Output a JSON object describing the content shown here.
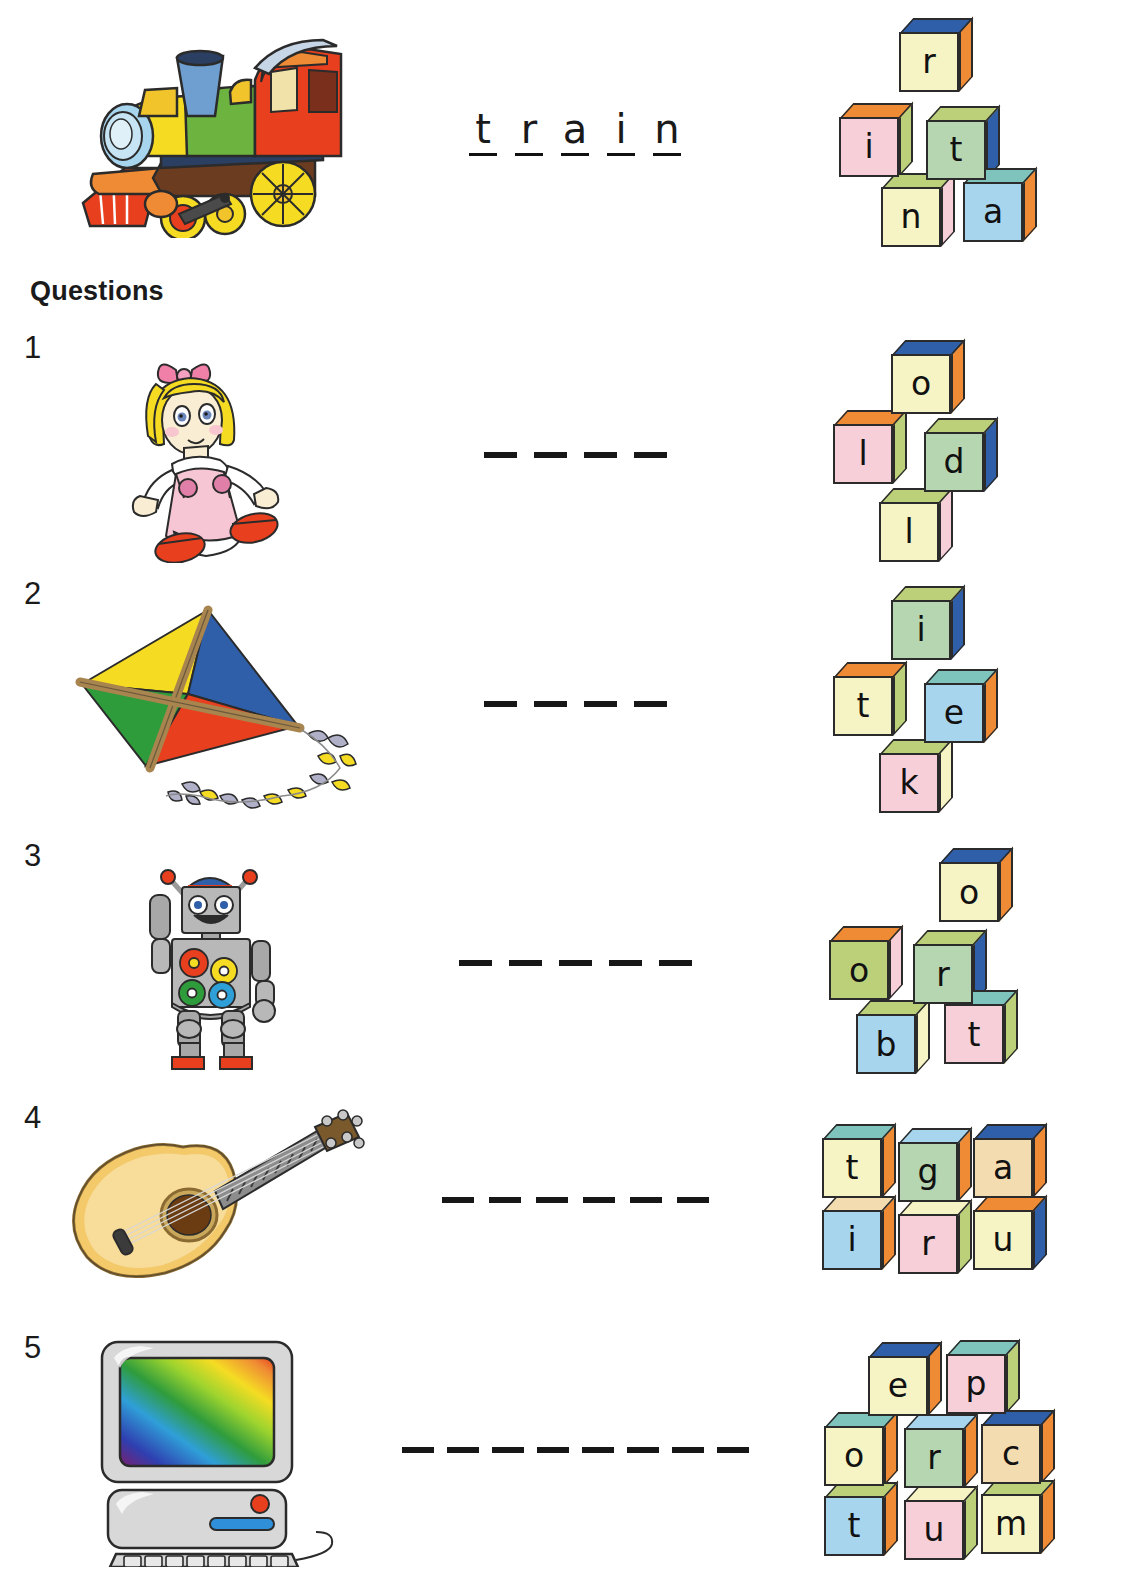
{
  "worksheet": {
    "questions_heading": "Questions"
  },
  "example": {
    "picture": "train-illustration",
    "word_letters": [
      "t",
      "r",
      "a",
      "i",
      "n"
    ],
    "blocks": [
      {
        "letter": "r",
        "front": "#f6f4c4",
        "top": "#2f5fa8",
        "side": "#ef8b34",
        "x": 78,
        "y": 10
      },
      {
        "letter": "i",
        "front": "#f6cfd8",
        "top": "#ef8b34",
        "side": "#bcd07a",
        "x": 18,
        "y": 95
      },
      {
        "letter": "t",
        "front": "#b5d6b0",
        "top": "#bcd07a",
        "side": "#2f5fa8",
        "x": 105,
        "y": 98
      },
      {
        "letter": "n",
        "front": "#f6f4c4",
        "top": "#bcd07a",
        "side": "#f6cfd8",
        "x": 60,
        "y": 165
      },
      {
        "letter": "a",
        "front": "#a8d5ee",
        "top": "#7ec4bd",
        "side": "#ef8b34",
        "x": 142,
        "y": 160
      }
    ]
  },
  "questions": [
    {
      "number": "1",
      "picture": "doll-illustration",
      "blank_count": 4,
      "blocks": [
        {
          "letter": "o",
          "front": "#f6f4c4",
          "top": "#2f5fa8",
          "side": "#ef8b34",
          "x": 70,
          "y": 2
        },
        {
          "letter": "l",
          "front": "#f6cfd8",
          "top": "#ef8b34",
          "side": "#bcd07a",
          "x": 12,
          "y": 72
        },
        {
          "letter": "d",
          "front": "#b5d6b0",
          "top": "#bcd07a",
          "side": "#2f5fa8",
          "x": 103,
          "y": 80
        },
        {
          "letter": "l",
          "front": "#f6f4c4",
          "top": "#bcd07a",
          "side": "#f6cfd8",
          "x": 58,
          "y": 150
        }
      ]
    },
    {
      "number": "2",
      "picture": "kite-illustration",
      "blank_count": 4,
      "blocks": [
        {
          "letter": "i",
          "front": "#b5d6b0",
          "top": "#bcd07a",
          "side": "#2f5fa8",
          "x": 70,
          "y": 2
        },
        {
          "letter": "t",
          "front": "#f6f4c4",
          "top": "#ef8b34",
          "side": "#bcd07a",
          "x": 12,
          "y": 78
        },
        {
          "letter": "e",
          "front": "#a8d5ee",
          "top": "#7ec4bd",
          "side": "#ef8b34",
          "x": 103,
          "y": 85
        },
        {
          "letter": "k",
          "front": "#f6cfd8",
          "top": "#bcd07a",
          "side": "#f6f4c4",
          "x": 58,
          "y": 155
        }
      ]
    },
    {
      "number": "3",
      "picture": "robot-illustration",
      "blank_count": 5,
      "blocks": [
        {
          "letter": "o",
          "front": "#f6f4c4",
          "top": "#2f5fa8",
          "side": "#ef8b34",
          "x": 118,
          "y": 0
        },
        {
          "letter": "o",
          "front": "#bcd07a",
          "top": "#ef8b34",
          "side": "#f6cfd8",
          "x": 8,
          "y": 78
        },
        {
          "letter": "r",
          "front": "#b5d6b0",
          "top": "#bcd07a",
          "side": "#2f5fa8",
          "x": 92,
          "y": 82
        },
        {
          "letter": "b",
          "front": "#a8d5ee",
          "top": "#bcd07a",
          "side": "#f6f4c4",
          "x": 35,
          "y": 152
        },
        {
          "letter": "t",
          "front": "#f6cfd8",
          "top": "#7ec4bd",
          "side": "#bcd07a",
          "x": 123,
          "y": 142
        }
      ]
    },
    {
      "number": "4",
      "picture": "guitar-illustration",
      "blank_count": 6,
      "blocks": [
        {
          "letter": "t",
          "front": "#f6f4c4",
          "top": "#7ec4bd",
          "side": "#ef8b34",
          "x": 6,
          "y": 6
        },
        {
          "letter": "g",
          "front": "#b5d6b0",
          "top": "#a8d5ee",
          "side": "#ef8b34",
          "x": 82,
          "y": 10
        },
        {
          "letter": "a",
          "front": "#f3dcb0",
          "top": "#2f5fa8",
          "side": "#ef8b34",
          "x": 157,
          "y": 6
        },
        {
          "letter": "i",
          "front": "#a8d5ee",
          "top": "#f3dcb0",
          "side": "#ef8b34",
          "x": 6,
          "y": 78
        },
        {
          "letter": "r",
          "front": "#f6cfd8",
          "top": "#f6f4c4",
          "side": "#bcd07a",
          "x": 82,
          "y": 82
        },
        {
          "letter": "u",
          "front": "#f6f4c4",
          "top": "#ef8b34",
          "side": "#2f5fa8",
          "x": 157,
          "y": 78
        }
      ]
    },
    {
      "number": "5",
      "picture": "computer-illustration",
      "blank_count": 8,
      "blocks": [
        {
          "letter": "e",
          "front": "#f6f4c4",
          "top": "#2f5fa8",
          "side": "#ef8b34",
          "x": 52,
          "y": 2
        },
        {
          "letter": "p",
          "front": "#f6cfd8",
          "top": "#7ec4bd",
          "side": "#bcd07a",
          "x": 130,
          "y": 0
        },
        {
          "letter": "o",
          "front": "#f6f4c4",
          "top": "#7ec4bd",
          "side": "#ef8b34",
          "x": 8,
          "y": 72
        },
        {
          "letter": "r",
          "front": "#b5d6b0",
          "top": "#a8d5ee",
          "side": "#ef8b34",
          "x": 88,
          "y": 74
        },
        {
          "letter": "c",
          "front": "#f3dcb0",
          "top": "#2f5fa8",
          "side": "#ef8b34",
          "x": 165,
          "y": 70
        },
        {
          "letter": "t",
          "front": "#a8d5ee",
          "top": "#bcd07a",
          "side": "#ef8b34",
          "x": 8,
          "y": 142
        },
        {
          "letter": "u",
          "front": "#f6cfd8",
          "top": "#f6f4c4",
          "side": "#bcd07a",
          "x": 88,
          "y": 146
        },
        {
          "letter": "m",
          "front": "#f6f4c4",
          "top": "#bcd07a",
          "side": "#ef8b34",
          "x": 165,
          "y": 140
        }
      ]
    }
  ]
}
